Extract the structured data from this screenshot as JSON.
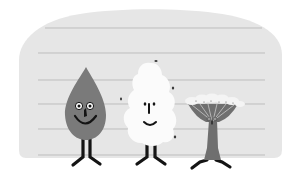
{
  "scene": {
    "description": "Cartoon illustration of three plant-like characters standing in a lineup in front of a height chart wall",
    "colors": {
      "page_bg": "#ffffff",
      "wall": "#e6e6e6",
      "wall_line": "#bdbdbd",
      "drop_body": "#7a7a7a",
      "cotton_body": "#fbfbfb",
      "flower_stem": "#6f6f6f",
      "flower_head": "#f4f4f4",
      "ink": "#141414",
      "eye_white": "#ffffff"
    },
    "wall": {
      "line_positions_y": [
        28,
        53,
        80,
        104,
        129,
        155
      ]
    },
    "characters": [
      {
        "name": "drop",
        "label": "drop-character",
        "expression": "smiling"
      },
      {
        "name": "cotton",
        "label": "cotton-character",
        "expression": "smiling"
      },
      {
        "name": "umbrella-flower",
        "label": "umbrella-flower-character",
        "expression": "neutral"
      }
    ]
  }
}
